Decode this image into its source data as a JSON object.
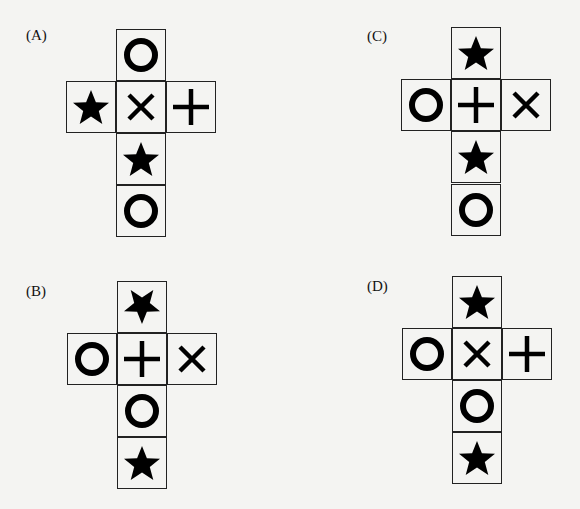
{
  "figure": {
    "symbols_legend": {
      "circle": "O",
      "star": "★",
      "cross": "×",
      "plus": "+"
    },
    "options": [
      {
        "label": "(A)",
        "cells": {
          "top": "circle",
          "left": "star",
          "center": "cross",
          "right": "plus",
          "below": "star",
          "bottom": "circle"
        }
      },
      {
        "label": "(B)",
        "cells": {
          "top": "star-inverted",
          "left": "circle",
          "center": "plus",
          "right": "cross",
          "below": "circle",
          "bottom": "star"
        }
      },
      {
        "label": "(C)",
        "cells": {
          "top": "star",
          "left": "circle",
          "center": "plus",
          "right": "cross",
          "below": "star",
          "bottom": "circle"
        }
      },
      {
        "label": "(D)",
        "cells": {
          "top": "star",
          "left": "circle",
          "center": "cross",
          "right": "plus",
          "below": "circle",
          "bottom": "star"
        }
      }
    ]
  }
}
